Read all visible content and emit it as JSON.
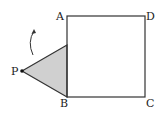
{
  "diagram": {
    "labels": {
      "A": "A",
      "B": "B",
      "C": "C",
      "D": "D",
      "P": "P"
    },
    "colors": {
      "stroke": "#333333",
      "triangle_fill": "#d0d0d0"
    }
  }
}
